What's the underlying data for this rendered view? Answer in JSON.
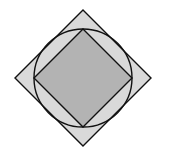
{
  "figure": {
    "center": [
      83,
      78
    ],
    "outer_square": {
      "half_diagonal": 68,
      "fill": "#d9d9d9",
      "stroke": "#111111"
    },
    "circle": {
      "radius": 49,
      "fill": "none",
      "stroke": "#111111"
    },
    "inner_square": {
      "half_diagonal": 49,
      "fill": "#b3b3b3",
      "stroke": "#111111"
    }
  }
}
